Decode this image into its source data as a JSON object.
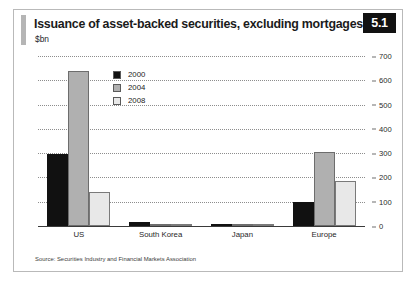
{
  "figure": {
    "title": "Issuance of asset-backed securities, excluding mortgages",
    "subtitle": "$bn",
    "badge": "5.1",
    "source": "Source: Securities Industry and Financial Markets Association"
  },
  "chart_data": {
    "type": "bar",
    "title": "Issuance of asset-backed securities, excluding mortgages",
    "subtitle": "$bn",
    "xlabel": "",
    "ylabel": "$bn",
    "ylim": [
      0,
      700
    ],
    "yticks": [
      0,
      100,
      200,
      300,
      400,
      500,
      600,
      700
    ],
    "grid": true,
    "legend_position": "top-left-inside",
    "categories": [
      "US",
      "South Korea",
      "Japan",
      "Europe"
    ],
    "series": [
      {
        "name": "2000",
        "color": "#111111",
        "values": [
          295,
          15,
          10,
          100
        ]
      },
      {
        "name": "2004",
        "color": "#b0b0b0",
        "values": [
          640,
          8,
          5,
          305
        ]
      },
      {
        "name": "2008",
        "color": "#e8e8e8",
        "values": [
          140,
          5,
          3,
          185
        ]
      }
    ],
    "annotations": [
      "Source: Securities Industry and Financial Markets Association"
    ]
  }
}
